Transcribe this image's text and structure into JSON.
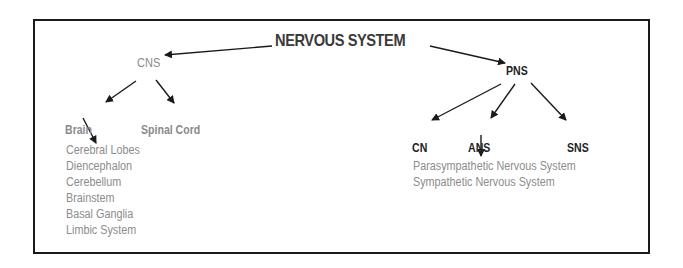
{
  "diagram": {
    "title": "NERVOUS SYSTEM",
    "cns": {
      "label": "CNS",
      "children": {
        "brain": "Brain",
        "spinal_cord": "Spinal Cord"
      },
      "brain_parts": [
        "Cerebral Lobes",
        "Diencephalon",
        "Cerebellum",
        "Brainstem",
        "Basal Ganglia",
        "Limbic System"
      ]
    },
    "pns": {
      "label": "PNS",
      "children": {
        "cn": "CN",
        "ans": "ANS",
        "sns": "SNS"
      },
      "ans_parts": [
        "Parasympathetic Nervous System",
        "Sympathetic Nervous System"
      ]
    },
    "colors": {
      "border": "#1a1a1a",
      "title": "#3a3a3a",
      "cns_branch": "#8a8a8a",
      "pns_branch": "#222222",
      "list_text": "#8c8c8c"
    }
  }
}
